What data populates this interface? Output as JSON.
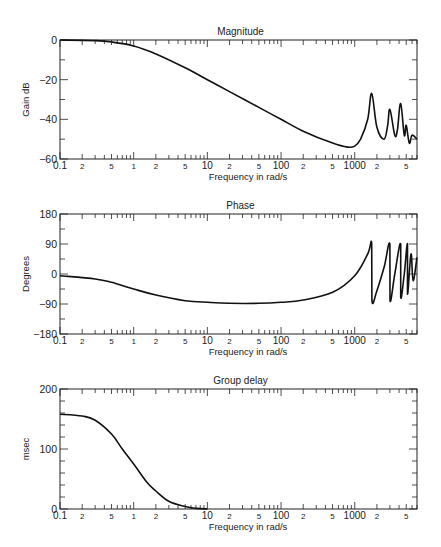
{
  "chart_data": [
    {
      "type": "line",
      "title": "Magnitude",
      "xlabel": "Frequency in rad/s",
      "ylabel": "Gain dB",
      "xscale": "log",
      "xlim": [
        0.1,
        7000
      ],
      "ylim": [
        -60,
        0
      ],
      "yticks": [
        0,
        -20,
        -40,
        -60
      ],
      "ytick_labels": [
        "0",
        "−20",
        "−40",
        "−60"
      ],
      "grid": false,
      "x": [
        0.1,
        0.3,
        0.5,
        1,
        2,
        5,
        10,
        20,
        50,
        100,
        200,
        500,
        800,
        1000,
        1200,
        1500,
        1700,
        2000,
        2500,
        2800,
        3000,
        3500,
        3800,
        4200,
        4700,
        5000,
        5500,
        6000,
        7000
      ],
      "values": [
        0,
        -0.3,
        -1,
        -3,
        -7,
        -14,
        -20,
        -26,
        -34,
        -40,
        -46,
        -52,
        -54,
        -53.5,
        -50,
        -40,
        -27,
        -44,
        -50,
        -43,
        -35,
        -48,
        -45,
        -32,
        -48,
        -43,
        -52,
        -48,
        -50
      ],
      "annotations": [
        "Resonance peaks near 1700, 3000, 4200, 5300 rad/s"
      ]
    },
    {
      "type": "line",
      "title": "Phase",
      "xlabel": "Frequency in rad/s",
      "ylabel": "Degrees",
      "xscale": "log",
      "xlim": [
        0.1,
        7000
      ],
      "ylim": [
        -180,
        180
      ],
      "yticks": [
        180,
        90,
        0,
        -90,
        -180
      ],
      "ytick_labels": [
        "180",
        "90",
        "0",
        "−90",
        "−180"
      ],
      "grid": false,
      "x": [
        0.1,
        0.3,
        0.5,
        1,
        2,
        5,
        10,
        20,
        50,
        100,
        200,
        500,
        1000,
        1500,
        1700,
        1710,
        2000,
        2500,
        3000,
        3010,
        3500,
        4200,
        4210,
        4700,
        5200,
        5210,
        5800,
        6200,
        7000
      ],
      "values": [
        -5,
        -15,
        -25,
        -45,
        -63,
        -80,
        -85,
        -88,
        -88,
        -85,
        -78,
        -55,
        -5,
        60,
        90,
        -80,
        -50,
        20,
        90,
        -80,
        0,
        90,
        -70,
        0,
        90,
        -60,
        60,
        -20,
        50
      ]
    },
    {
      "type": "line",
      "title": "Group delay",
      "xlabel": "Frequency in rad/s",
      "ylabel": "msec",
      "xscale": "log",
      "xlim": [
        0.1,
        7000
      ],
      "ylim": [
        0,
        200
      ],
      "yticks": [
        200,
        100,
        0
      ],
      "ytick_labels": [
        "200",
        "100",
        "0"
      ],
      "grid": false,
      "x": [
        0.1,
        0.2,
        0.3,
        0.5,
        0.7,
        1,
        1.5,
        2,
        3,
        5,
        7,
        10
      ],
      "values": [
        158,
        155,
        148,
        125,
        100,
        75,
        45,
        30,
        13,
        4,
        1,
        0
      ]
    }
  ],
  "x_tick_labels": [
    {
      "value": 0.1,
      "label": "0.1"
    },
    {
      "value": 0.2,
      "label": "2"
    },
    {
      "value": 0.5,
      "label": "5"
    },
    {
      "value": 1,
      "label": "1"
    },
    {
      "value": 2,
      "label": "2"
    },
    {
      "value": 5,
      "label": "5"
    },
    {
      "value": 10,
      "label": "10"
    },
    {
      "value": 20,
      "label": "2"
    },
    {
      "value": 50,
      "label": "5"
    },
    {
      "value": 100,
      "label": "100"
    },
    {
      "value": 200,
      "label": "2"
    },
    {
      "value": 500,
      "label": "5"
    },
    {
      "value": 1000,
      "label": "1000"
    },
    {
      "value": 2000,
      "label": "2"
    },
    {
      "value": 5000,
      "label": "5"
    }
  ]
}
